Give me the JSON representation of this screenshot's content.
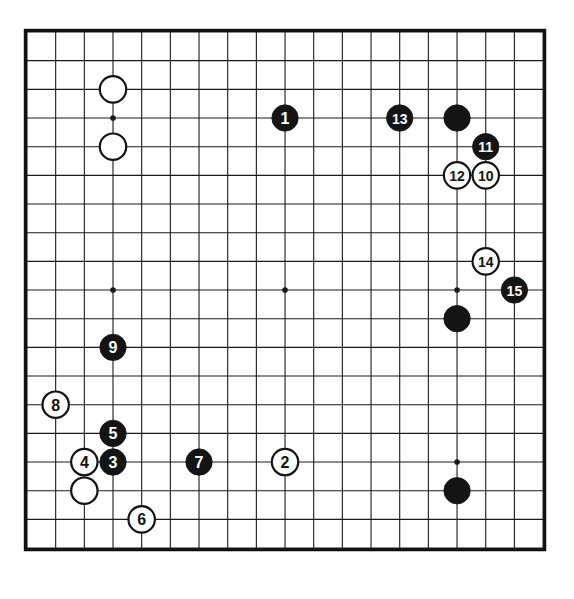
{
  "diagram": {
    "board_size": 19,
    "background_color": "#ffffff",
    "line_color": "#1a1a1a",
    "border_color": "#111111",
    "black_stone_color": "#141414",
    "white_stone_color": "#ffffff",
    "black_label_color": "#ffffff",
    "white_label_color": "#141414",
    "geometry": {
      "origin_x": 27,
      "origin_y": 32,
      "spacing": 28.67,
      "stone_radius": 13.2,
      "border_width": 3.2,
      "line_width": 1.1,
      "star_radius": 2.8
    },
    "star_points": [
      {
        "col": 3,
        "row": 3
      },
      {
        "col": 9,
        "row": 3
      },
      {
        "col": 15,
        "row": 3
      },
      {
        "col": 3,
        "row": 9
      },
      {
        "col": 9,
        "row": 9
      },
      {
        "col": 15,
        "row": 9
      },
      {
        "col": 3,
        "row": 15
      },
      {
        "col": 9,
        "row": 15
      },
      {
        "col": 15,
        "row": 15
      }
    ],
    "stones": [
      {
        "id": "white-prior-top-a",
        "color": "white",
        "label": "",
        "col": 3,
        "row": 2
      },
      {
        "id": "white-prior-top-b",
        "color": "white",
        "label": "",
        "col": 3,
        "row": 4
      },
      {
        "id": "black-move-1",
        "color": "black",
        "label": "1",
        "col": 9,
        "row": 3
      },
      {
        "id": "black-move-13",
        "color": "black",
        "label": "13",
        "col": 13,
        "row": 3
      },
      {
        "id": "black-prior-top-right",
        "color": "black",
        "label": "",
        "col": 15,
        "row": 3
      },
      {
        "id": "black-move-11",
        "color": "black",
        "label": "11",
        "col": 16,
        "row": 4
      },
      {
        "id": "white-move-12",
        "color": "white",
        "label": "12",
        "col": 15,
        "row": 5
      },
      {
        "id": "white-move-10",
        "color": "white",
        "label": "10",
        "col": 16,
        "row": 5
      },
      {
        "id": "white-move-14",
        "color": "white",
        "label": "14",
        "col": 16,
        "row": 8
      },
      {
        "id": "black-move-15",
        "color": "black",
        "label": "15",
        "col": 17,
        "row": 9
      },
      {
        "id": "black-prior-right",
        "color": "black",
        "label": "",
        "col": 15,
        "row": 10
      },
      {
        "id": "black-move-9",
        "color": "black",
        "label": "9",
        "col": 3,
        "row": 11
      },
      {
        "id": "white-move-8",
        "color": "white",
        "label": "8",
        "col": 1,
        "row": 13
      },
      {
        "id": "black-move-5",
        "color": "black",
        "label": "5",
        "col": 3,
        "row": 14
      },
      {
        "id": "white-move-4",
        "color": "white",
        "label": "4",
        "col": 2,
        "row": 15
      },
      {
        "id": "black-move-3",
        "color": "black",
        "label": "3",
        "col": 3,
        "row": 15
      },
      {
        "id": "black-move-7",
        "color": "black",
        "label": "7",
        "col": 6,
        "row": 15
      },
      {
        "id": "white-move-2",
        "color": "white",
        "label": "2",
        "col": 9,
        "row": 15
      },
      {
        "id": "black-prior-bottom-right",
        "color": "black",
        "label": "",
        "col": 15,
        "row": 16
      },
      {
        "id": "white-prior-bottom-left",
        "color": "white",
        "label": "",
        "col": 2,
        "row": 16
      },
      {
        "id": "white-move-6",
        "color": "white",
        "label": "6",
        "col": 4,
        "row": 17
      }
    ]
  }
}
